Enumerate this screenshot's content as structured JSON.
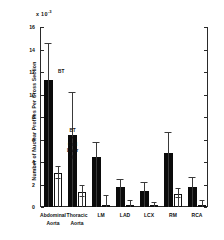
{
  "chart_data": {
    "type": "bar",
    "title": "",
    "subtitle": "",
    "xlabel": "",
    "ylabel": "Number of Nuclear Profiles Per Cross Section",
    "y_exponent_label": "x 10",
    "y_exponent_power": "-3",
    "ylim": [
      0,
      16
    ],
    "yticks": [
      0,
      2,
      4,
      6,
      8,
      10,
      12,
      14,
      16
    ],
    "ytick_labels": [
      "0",
      "2",
      "4",
      "6",
      "8",
      "10",
      "12",
      "14",
      "16"
    ],
    "grid": false,
    "legend_position": "in-plot annotations",
    "categories": [
      "Abdominal Aorta",
      "Thoracic Aorta",
      "LM",
      "LAD",
      "LCX",
      "RM",
      "RCA"
    ],
    "category_lines": [
      [
        "Abdominal",
        "Aorta"
      ],
      [
        "Thoracic",
        "Aorta"
      ],
      [
        "LM",
        ""
      ],
      [
        "LAD",
        ""
      ],
      [
        "LCX",
        ""
      ],
      [
        "RM",
        ""
      ],
      [
        "RCA",
        ""
      ]
    ],
    "series": [
      {
        "name": "BT",
        "fill": "black",
        "color": "#0b0b0b",
        "values": [
          11.3,
          6.4,
          4.45,
          1.8,
          1.4,
          4.8,
          1.8
        ],
        "error_upper": [
          14.5,
          10.1,
          5.7,
          2.4,
          2.1,
          6.6,
          2.6
        ]
      },
      {
        "name": "BT + Cod Liver Oil",
        "fill": "white",
        "color": "#ffffff",
        "values": [
          3.05,
          1.35,
          0.15,
          0.12,
          0.08,
          1.2,
          0.1
        ],
        "error_upper": [
          3.6,
          1.85,
          0.95,
          0.55,
          0.4,
          1.6,
          0.55
        ]
      }
    ],
    "annotations": [
      {
        "text": "BT",
        "lines": [
          "BT"
        ]
      },
      {
        "text": "BT + Cod Liver Oil",
        "lines": [
          "BT",
          "+",
          "Cod",
          "Liver",
          "Oil"
        ]
      }
    ]
  }
}
